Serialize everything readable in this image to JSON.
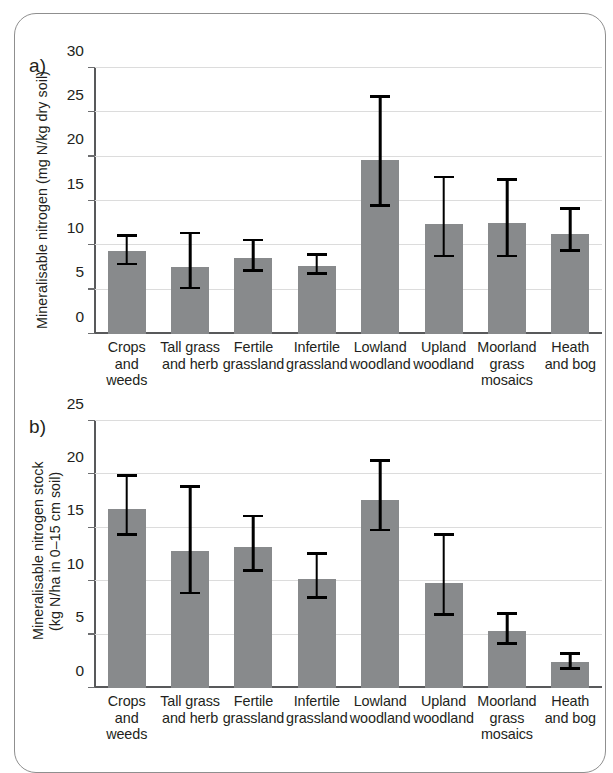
{
  "figure": {
    "panels": [
      {
        "letter": "a)"
      },
      {
        "letter": "b)"
      }
    ]
  },
  "chart_data": [
    {
      "type": "bar",
      "panel": "a)",
      "title": "",
      "xlabel": "",
      "ylabel": "Mineralisable nitrogen (mg N/kg dry soil)",
      "ylim": [
        0,
        30
      ],
      "yticks": [
        0,
        5,
        10,
        15,
        20,
        25,
        30
      ],
      "grid": true,
      "legend": "none",
      "error_bars": "asymmetric confidence interval",
      "bar_color": "#888a8c",
      "categories": [
        "Crops and\nweeds",
        "Tall grass\nand herb",
        "Fertile\ngrassland",
        "Infertile\ngrassland",
        "Lowland\nwoodland",
        "Upland\nwoodland",
        "Moorland\ngrass\nmosaics",
        "Heath\nand bog"
      ],
      "values": [
        9.4,
        7.6,
        8.6,
        7.7,
        19.6,
        12.4,
        12.5,
        11.3
      ],
      "err_low": [
        7.9,
        5.2,
        7.2,
        6.8,
        14.5,
        8.8,
        8.8,
        9.4
      ],
      "err_high": [
        11.1,
        11.4,
        10.6,
        9.0,
        26.8,
        17.7,
        17.4,
        14.2
      ]
    },
    {
      "type": "bar",
      "panel": "b)",
      "title": "",
      "xlabel": "",
      "ylabel": "Mineralisable nitrogen stock\n(kg N/ha in 0–15 cm soil)",
      "ylim": [
        0,
        25
      ],
      "yticks": [
        0,
        5,
        10,
        15,
        20,
        25
      ],
      "grid": true,
      "legend": "none",
      "error_bars": "asymmetric confidence interval",
      "bar_color": "#888a8c",
      "categories": [
        "Crops and\nweeds",
        "Tall grass\nand herb",
        "Fertile\ngrassland",
        "Infertile\ngrassland",
        "Lowland\nwoodland",
        "Upland\nwoodland",
        "Moorland\ngrass\nmosaics",
        "Heath\nand bog"
      ],
      "values": [
        16.8,
        12.8,
        13.2,
        10.2,
        17.6,
        9.8,
        5.3,
        2.4
      ],
      "err_low": [
        14.4,
        8.9,
        11.0,
        8.5,
        14.8,
        6.9,
        4.2,
        1.8
      ],
      "err_high": [
        19.9,
        18.9,
        16.1,
        12.6,
        21.3,
        14.4,
        7.0,
        3.2
      ]
    }
  ]
}
